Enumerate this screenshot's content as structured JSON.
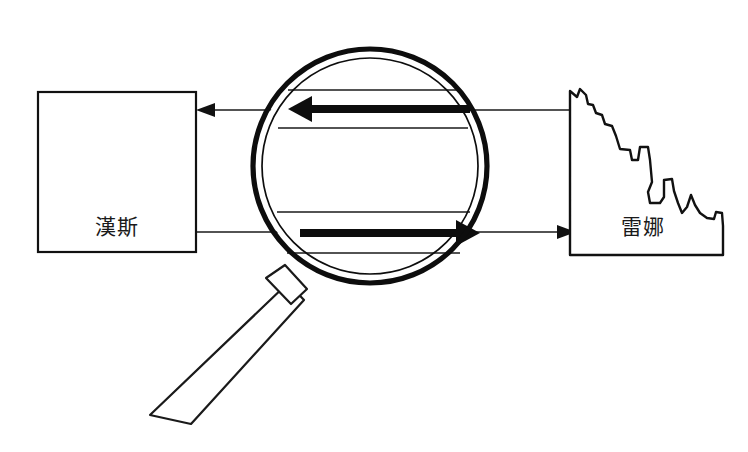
{
  "diagram": {
    "background_color": "#ffffff",
    "line_color": "#111111",
    "text_color": "#1a1a1a",
    "nodes": [
      {
        "id": "left-party",
        "label": "漢斯",
        "shape": "rectangle",
        "x": 38,
        "y": 92,
        "width": 158,
        "height": 160
      },
      {
        "id": "right-party",
        "label": "雷娜",
        "shape": "jagged-polygon",
        "x": 568,
        "y": 88,
        "width": 157,
        "height": 167
      }
    ],
    "connections": [
      {
        "id": "reply-channel",
        "from": "right-party",
        "to": "left-party",
        "direction": "right-to-left",
        "y": 110,
        "style": "thin"
      },
      {
        "id": "request-channel",
        "from": "left-party",
        "to": "right-party",
        "direction": "left-to-right",
        "y": 232,
        "style": "thin"
      }
    ],
    "magnifier": {
      "id": "magnifying-glass",
      "center_x": 370,
      "center_y": 166,
      "radius": 117,
      "handle_angle_deg": 228,
      "arrows": [
        {
          "id": "magnified-reply-arrow",
          "direction": "left",
          "y": 109,
          "x_start": 470,
          "x_end": 293,
          "style": "bold"
        },
        {
          "id": "magnified-request-arrow",
          "direction": "right",
          "y": 233,
          "x_start": 300,
          "x_end": 477,
          "style": "bold"
        }
      ]
    }
  }
}
